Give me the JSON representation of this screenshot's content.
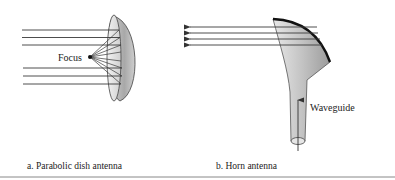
{
  "figure": {
    "panels": [
      {
        "id": "a",
        "caption": "a. Parabolic dish antenna",
        "labels": {
          "focus": "Focus"
        }
      },
      {
        "id": "b",
        "caption": "b. Horn antenna",
        "labels": {
          "waveguide": "Waveguide"
        }
      }
    ]
  },
  "colors": {
    "line": "#3a3a3a",
    "rim": "#1a1a1a",
    "metal_light": "#e4e4e4",
    "metal_dark": "#9a9a9a",
    "rule": "#888888"
  }
}
